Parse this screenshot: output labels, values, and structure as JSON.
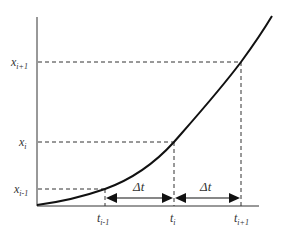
{
  "diagram": {
    "title": "",
    "y_labels": [
      {
        "id": "x_ip1",
        "base": "x",
        "sub": "i+1",
        "y": 62
      },
      {
        "id": "x_i",
        "base": "x",
        "sub": "i",
        "y": 142
      },
      {
        "id": "x_im1",
        "base": "x",
        "sub": "i-1",
        "y": 189
      }
    ],
    "x_labels": [
      {
        "id": "t_im1",
        "base": "t",
        "sub": "i-1",
        "x": 105
      },
      {
        "id": "t_i",
        "base": "t",
        "sub": "i",
        "x": 174
      },
      {
        "id": "t_ip1",
        "base": "t",
        "sub": "i+1",
        "x": 241
      }
    ],
    "intervals": [
      {
        "label": "Δt",
        "from": "t_im1",
        "to": "t_i"
      },
      {
        "label": "Δt",
        "from": "t_i",
        "to": "t_ip1"
      }
    ],
    "colors": {
      "curve": "#111111",
      "axis": "#333333",
      "dashed": "#333333",
      "text": "#333333"
    }
  }
}
